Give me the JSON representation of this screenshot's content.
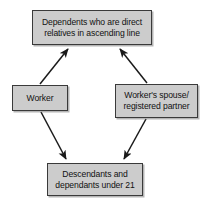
{
  "diagram": {
    "type": "relationship-diagram",
    "background_color": "#ffffff",
    "node_fill_color": "#cccccc",
    "node_border_color": "#3a3a3a",
    "arrow_color": "#1a1a1a",
    "nodes": [
      {
        "id": "ascending",
        "label": "Dependents who are direct\nrelatives in ascending line",
        "position": "top"
      },
      {
        "id": "worker",
        "label": "Worker",
        "position": "left"
      },
      {
        "id": "spouse",
        "label": "Worker's spouse/\nregistered partner",
        "position": "right"
      },
      {
        "id": "descendants",
        "label": "Descendants and\ndependants under 21",
        "position": "bottom"
      }
    ],
    "edges": [
      {
        "id": "worker-to-ascending",
        "from": "worker",
        "to": "ascending",
        "direction": "up-right"
      },
      {
        "id": "spouse-to-ascending",
        "from": "spouse",
        "to": "ascending",
        "direction": "up-left"
      },
      {
        "id": "worker-to-descendants",
        "from": "worker",
        "to": "descendants",
        "direction": "down-right"
      },
      {
        "id": "spouse-to-descendants",
        "from": "spouse",
        "to": "descendants",
        "direction": "down-left"
      }
    ]
  }
}
